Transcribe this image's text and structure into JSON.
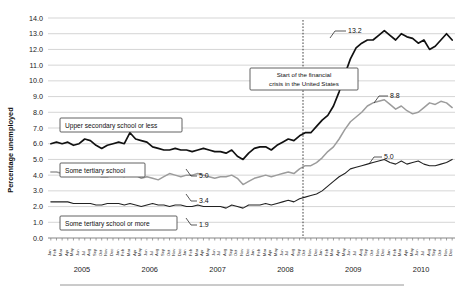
{
  "chart_data": {
    "type": "line",
    "title": "",
    "xlabel": "",
    "ylabel": "Percentage unemployed",
    "ylim": [
      0.0,
      14.0
    ],
    "ytick_labels": [
      "0.0",
      "1.0",
      "2.0",
      "3.0",
      "4.0",
      "5.0",
      "6.0",
      "7.0",
      "8.0",
      "9.0",
      "10.0",
      "11.0",
      "12.0",
      "13.0",
      "14.0"
    ],
    "grid": true,
    "legend_position": "inline-annotations",
    "years": [
      "2005",
      "2006",
      "2007",
      "2008",
      "2009",
      "2010"
    ],
    "months": [
      "Jan",
      "Feb",
      "Mar",
      "Apr",
      "May",
      "Jun",
      "Jul",
      "Aug",
      "Sep",
      "Oct",
      "Nov",
      "Dec"
    ],
    "x_tick_count": 72,
    "series": [
      {
        "name": "Upper secondary school or less",
        "color": "#111111",
        "style": "thick-black",
        "values": [
          6.0,
          6.1,
          6.0,
          6.1,
          5.9,
          6.0,
          6.3,
          6.2,
          5.9,
          5.7,
          5.9,
          6.0,
          6.1,
          6.0,
          6.7,
          6.3,
          6.2,
          6.1,
          5.8,
          5.7,
          5.6,
          5.6,
          5.7,
          5.6,
          5.6,
          5.5,
          5.6,
          5.7,
          5.6,
          5.5,
          5.5,
          5.4,
          5.6,
          5.2,
          5.0,
          5.4,
          5.7,
          5.8,
          5.8,
          5.6,
          5.9,
          6.1,
          6.3,
          6.2,
          6.5,
          6.7,
          6.7,
          7.1,
          7.5,
          7.8,
          8.4,
          9.3,
          10.4,
          11.4,
          12.1,
          12.4,
          12.6,
          12.6,
          12.9,
          13.2,
          12.9,
          12.6,
          13.0,
          12.8,
          12.7,
          12.4,
          12.6,
          12.0,
          12.2,
          12.6,
          13.0,
          12.6
        ]
      },
      {
        "name": "Some tertiary school",
        "color": "#9c9c9c",
        "style": "gray",
        "values": [
          4.2,
          4.2,
          4.1,
          4.2,
          4.1,
          4.0,
          4.1,
          4.1,
          4.0,
          3.9,
          3.9,
          4.0,
          4.0,
          3.9,
          4.1,
          4.0,
          3.8,
          3.9,
          3.8,
          3.7,
          3.9,
          4.1,
          4.0,
          3.9,
          4.0,
          4.0,
          4.1,
          4.0,
          3.9,
          3.8,
          3.9,
          3.9,
          4.0,
          3.8,
          3.4,
          3.6,
          3.8,
          3.9,
          4.0,
          3.9,
          4.0,
          4.1,
          4.2,
          4.1,
          4.4,
          4.6,
          4.6,
          4.8,
          5.1,
          5.5,
          5.8,
          6.3,
          6.9,
          7.4,
          7.7,
          8.0,
          8.4,
          8.6,
          8.7,
          8.8,
          8.5,
          8.2,
          8.4,
          8.1,
          7.9,
          8.0,
          8.3,
          8.6,
          8.5,
          8.7,
          8.6,
          8.3
        ]
      },
      {
        "name": "Some tertiary school or more",
        "color": "#222222",
        "style": "thin-black",
        "values": [
          2.3,
          2.3,
          2.3,
          2.3,
          2.2,
          2.2,
          2.2,
          2.2,
          2.1,
          2.1,
          2.2,
          2.2,
          2.2,
          2.1,
          2.2,
          2.1,
          2.0,
          2.1,
          2.2,
          2.1,
          2.1,
          2.0,
          2.1,
          2.1,
          2.0,
          2.0,
          2.1,
          2.0,
          2.0,
          2.0,
          2.0,
          1.9,
          2.1,
          2.0,
          1.9,
          2.1,
          2.1,
          2.1,
          2.2,
          2.1,
          2.2,
          2.3,
          2.4,
          2.3,
          2.5,
          2.6,
          2.7,
          2.8,
          3.0,
          3.3,
          3.6,
          3.9,
          4.1,
          4.4,
          4.5,
          4.6,
          4.7,
          4.8,
          4.9,
          5.0,
          4.8,
          4.7,
          4.9,
          4.7,
          4.8,
          4.9,
          4.7,
          4.6,
          4.6,
          4.7,
          4.8,
          5.0
        ]
      }
    ],
    "data_labels": [
      {
        "text": "13.2",
        "series": "Upper secondary school or less"
      },
      {
        "text": "8.8",
        "series": "Some tertiary school"
      },
      {
        "text": "5.0",
        "series": "Some tertiary school or more"
      },
      {
        "text": "5.0",
        "series": "Upper secondary school or less"
      },
      {
        "text": "3.4",
        "series": "Some tertiary school"
      },
      {
        "text": "1.9",
        "series": "Some tertiary school or more"
      }
    ],
    "annotations": [
      {
        "name": "crisis-marker",
        "line1": "Start of the financial",
        "line2": "crisis in the United States"
      }
    ]
  },
  "callouts": {
    "upper_secondary": "Upper secondary school or less",
    "some_tertiary": "Some tertiary school",
    "some_tertiary_more": "Some tertiary school or more"
  },
  "labels": {
    "v13_2": "13.2",
    "v8_8": "8.8",
    "v5_0_right": "5.0",
    "v5_0_left": "5.0",
    "v3_4": "3.4",
    "v1_9": "1.9"
  },
  "crisis": {
    "line1": "Start of the financial",
    "line2": "crisis in the United States"
  },
  "axis": {
    "y_title": "Percentage unemployed",
    "y_ticks": [
      "14.0",
      "13.0",
      "12.0",
      "11.0",
      "10.0",
      "9.0",
      "8.0",
      "7.0",
      "6.0",
      "5.0",
      "4.0",
      "3.0",
      "2.0",
      "1.0",
      "0.0"
    ],
    "years": [
      "2005",
      "2006",
      "2007",
      "2008",
      "2009",
      "2010"
    ],
    "months": [
      "Jan",
      "Feb",
      "Mar",
      "Apr",
      "May",
      "Jun",
      "Jul",
      "Aug",
      "Sep",
      "Oct",
      "Nov",
      "Dec"
    ]
  }
}
